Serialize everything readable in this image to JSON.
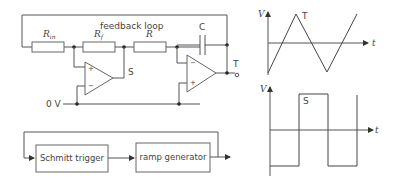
{
  "circuit": {
    "feedback_label": "feedback loop",
    "r_in_label": "R",
    "r_in_sub": "in",
    "r_f_label": "R",
    "r_f_sub": "f",
    "r_label": "R",
    "c_label": "C",
    "s_label": "S",
    "t_label": "T",
    "ground_label": "0 V",
    "plus": "+",
    "minus": "−"
  },
  "block_diagram": {
    "blocks": [
      {
        "label": "Schmitt trigger"
      },
      {
        "label": "ramp generator"
      }
    ]
  },
  "graphs": {
    "triangle": {
      "v_axis": "V",
      "t_axis": "t",
      "wave_label": "T"
    },
    "square": {
      "v_axis": "V",
      "t_axis": "t",
      "wave_label": "S"
    }
  }
}
